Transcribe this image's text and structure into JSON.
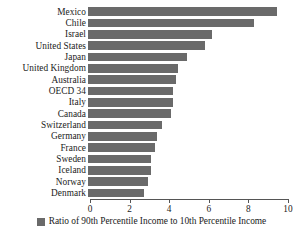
{
  "chart_data": {
    "type": "bar",
    "orientation": "horizontal",
    "title": "",
    "subtitle": "",
    "xlabel": "",
    "ylabel": "",
    "xlim": [
      0,
      10
    ],
    "xticks": [
      0,
      2,
      4,
      6,
      8,
      10
    ],
    "xtick_labels": [
      "0",
      "2",
      "4",
      "6",
      "8",
      "10"
    ],
    "grid": false,
    "legend_position": "bottom",
    "series_color": "#6a6a6a",
    "axis_color": "#555555",
    "text_color": "#1a1a1a",
    "background": "#ffffff",
    "categories": [
      "Mexico",
      "Chile",
      "Israel",
      "United States",
      "Japan",
      "United Kingdom",
      "Australia",
      "OECD 34",
      "Italy",
      "Canada",
      "Switzerland",
      "Germany",
      "France",
      "Sweden",
      "Iceland",
      "Norway",
      "Denmark"
    ],
    "values": [
      9.55,
      8.4,
      6.25,
      5.9,
      5.0,
      4.55,
      4.45,
      4.3,
      4.3,
      4.2,
      3.75,
      3.5,
      3.4,
      3.2,
      3.2,
      3.05,
      2.85
    ],
    "series": [
      {
        "name": "Ratio of 90th Percentile Income to 10th Percentile Income",
        "color": "#6a6a6a",
        "values": [
          9.55,
          8.4,
          6.25,
          5.9,
          5.0,
          4.55,
          4.45,
          4.3,
          4.3,
          4.2,
          3.75,
          3.5,
          3.4,
          3.2,
          3.2,
          3.05,
          2.85
        ]
      }
    ]
  },
  "legend": {
    "label": "Ratio of 90th Percentile Income to 10th Percentile Income",
    "swatch_color": "#6a6a6a"
  }
}
